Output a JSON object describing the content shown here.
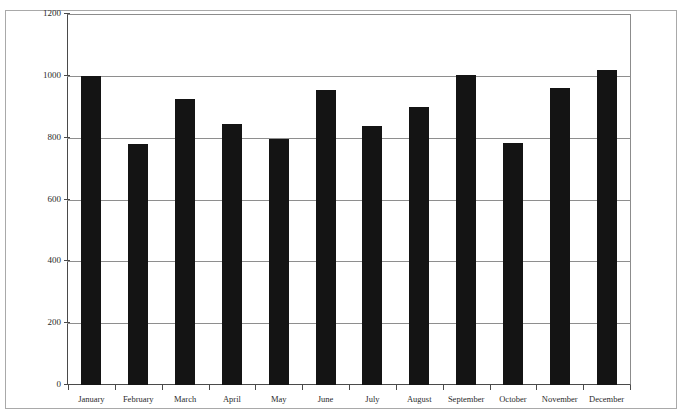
{
  "page": {
    "top_sliver_text": "",
    "background_color": "#ffffff"
  },
  "figure": {
    "frame_border_color": "#a9a9a9",
    "axis_color": "#4a4a4a",
    "gridline_color": "#8e8e8e",
    "bar_color": "#141414"
  },
  "chart_data": {
    "type": "bar",
    "title": "",
    "subtitle": "",
    "xlabel": "",
    "ylabel": "",
    "categories": [
      "January",
      "February",
      "March",
      "April",
      "May",
      "June",
      "July",
      "August",
      "September",
      "October",
      "November",
      "December"
    ],
    "values": [
      1000,
      778,
      925,
      845,
      796,
      955,
      838,
      898,
      1003,
      783,
      962,
      1020
    ],
    "series": [
      {
        "name": "",
        "values": [
          1000,
          778,
          925,
          845,
          796,
          955,
          838,
          898,
          1003,
          783,
          962,
          1020
        ]
      }
    ],
    "ylim": [
      0,
      1200
    ],
    "ytick_values": [
      0,
      200,
      400,
      600,
      800,
      1000,
      1200
    ],
    "ytick_labels": [
      "0",
      "200",
      "400",
      "600",
      "800",
      "1000",
      "1200"
    ],
    "grid": true,
    "grid_axis": "y",
    "legend": false,
    "legend_position": "none",
    "bar_color": "#141414",
    "annotations": []
  }
}
